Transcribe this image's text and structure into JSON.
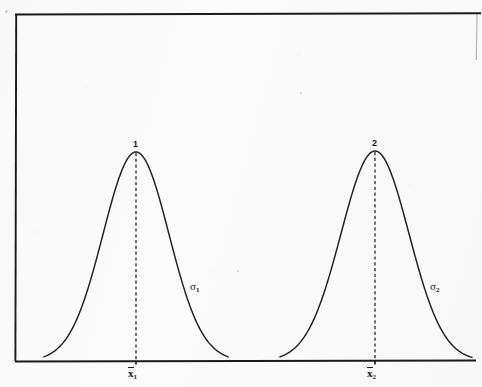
{
  "figure": {
    "kind": "statistical-illustration",
    "background_color": "#fbfbfc",
    "ink_color": "#18181a"
  },
  "frame": {
    "name": "plot-frame",
    "left_x": 15,
    "top_y": 14,
    "right_x": 476,
    "baseline_y": 361,
    "border_color": "#1a1a1c",
    "right_border_visible": false
  },
  "curves": [
    {
      "id": "curve-1",
      "peak_label": "1",
      "mean_label_base": "x",
      "mean_label_sub": "1",
      "sigma_label_base": "σ",
      "sigma_label_sub": "1",
      "mean_x": 136,
      "peak_y": 152,
      "sigma_px": 33,
      "left_foot_x": 44,
      "right_foot_x": 228,
      "peak_label_pos": {
        "x": 133,
        "y": 140
      },
      "sigma_label_pos": {
        "x": 190,
        "y": 281
      },
      "mean_label_pos": {
        "x": 128,
        "y": 367
      }
    },
    {
      "id": "curve-2",
      "peak_label": "2",
      "mean_label_base": "x",
      "mean_label_sub": "2",
      "sigma_label_base": "σ",
      "sigma_label_sub": "2",
      "mean_x": 375,
      "peak_y": 151,
      "sigma_px": 34,
      "left_foot_x": 280,
      "right_foot_x": 472,
      "peak_label_pos": {
        "x": 372,
        "y": 139
      },
      "sigma_label_pos": {
        "x": 430,
        "y": 281
      },
      "mean_label_pos": {
        "x": 367,
        "y": 367
      }
    }
  ],
  "chart_data": {
    "type": "line",
    "title": "",
    "subtitle": "",
    "xlabel": "",
    "ylabel": "",
    "grid": false,
    "legend": "none",
    "annotations": [
      {
        "text": "1",
        "role": "curve-peak-number",
        "attached_to": "curve-1"
      },
      {
        "text": "2",
        "role": "curve-peak-number",
        "attached_to": "curve-2"
      },
      {
        "text": "σ₁",
        "role": "spread-label",
        "attached_to": "curve-1"
      },
      {
        "text": "σ₂",
        "role": "spread-label",
        "attached_to": "curve-2"
      },
      {
        "text": "x̄1",
        "role": "mean-tick-label",
        "attached_to": "curve-1"
      },
      {
        "text": "x̄2",
        "role": "mean-tick-label",
        "attached_to": "curve-2"
      }
    ],
    "xlim": [
      15,
      476
    ],
    "ylim": [
      0,
      1
    ],
    "series": [
      {
        "name": "Distribution 1",
        "kind": "normal-pdf",
        "mean": 136,
        "sigma": 33,
        "peak_height": 1.0,
        "color": "#18181a"
      },
      {
        "name": "Distribution 2",
        "kind": "normal-pdf",
        "mean": 375,
        "sigma": 34,
        "peak_height": 1.0,
        "color": "#18181a"
      }
    ],
    "reference_lines": [
      {
        "name": "mean-line-1",
        "x": 136,
        "style": "dashed",
        "from_y": 0,
        "to_y": 1
      },
      {
        "name": "mean-line-2",
        "x": 375,
        "style": "dashed",
        "from_y": 0,
        "to_y": 1
      }
    ]
  }
}
